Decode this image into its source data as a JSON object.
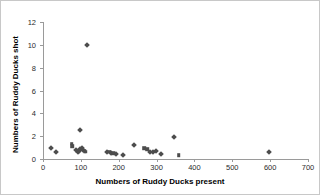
{
  "chart_data": {
    "type": "scatter",
    "title": "",
    "xlabel": "Numbers of Ruddy Ducks present",
    "ylabel": "Numbers of Ruddy Ducks shot",
    "xlim": [
      0,
      700
    ],
    "ylim": [
      0,
      12
    ],
    "xticks": [
      0,
      100,
      200,
      300,
      400,
      500,
      600,
      700
    ],
    "yticks": [
      0,
      2,
      4,
      6,
      8,
      10,
      12
    ],
    "grid": false,
    "legend": false,
    "marker_color": "#4d4d4d",
    "axis_color": "#9a9a9a",
    "points": [
      {
        "x": 20,
        "y": 1.0,
        "marker": "diamond"
      },
      {
        "x": 35,
        "y": 0.6,
        "marker": "diamond"
      },
      {
        "x": 76,
        "y": 1.35,
        "marker": "square"
      },
      {
        "x": 77,
        "y": 1.1,
        "marker": "square"
      },
      {
        "x": 88,
        "y": 0.75,
        "marker": "diamond"
      },
      {
        "x": 92,
        "y": 0.65,
        "marker": "diamond"
      },
      {
        "x": 95,
        "y": 0.7,
        "marker": "diamond"
      },
      {
        "x": 98,
        "y": 2.55,
        "marker": "diamond"
      },
      {
        "x": 99,
        "y": 0.85,
        "marker": "diamond"
      },
      {
        "x": 103,
        "y": 0.95,
        "marker": "diamond"
      },
      {
        "x": 106,
        "y": 0.8,
        "marker": "diamond"
      },
      {
        "x": 110,
        "y": 0.7,
        "marker": "square"
      },
      {
        "x": 113,
        "y": 0.65,
        "marker": "square"
      },
      {
        "x": 115,
        "y": 10.0,
        "marker": "diamond"
      },
      {
        "x": 170,
        "y": 0.6,
        "marker": "diamond"
      },
      {
        "x": 175,
        "y": 0.65,
        "marker": "square"
      },
      {
        "x": 180,
        "y": 0.55,
        "marker": "diamond"
      },
      {
        "x": 186,
        "y": 0.5,
        "marker": "square"
      },
      {
        "x": 193,
        "y": 0.45,
        "marker": "diamond"
      },
      {
        "x": 210,
        "y": 0.35,
        "marker": "diamond"
      },
      {
        "x": 240,
        "y": 1.2,
        "marker": "diamond"
      },
      {
        "x": 268,
        "y": 0.95,
        "marker": "square"
      },
      {
        "x": 275,
        "y": 0.85,
        "marker": "square"
      },
      {
        "x": 283,
        "y": 0.6,
        "marker": "diamond"
      },
      {
        "x": 290,
        "y": 0.6,
        "marker": "diamond"
      },
      {
        "x": 298,
        "y": 0.7,
        "marker": "diamond"
      },
      {
        "x": 312,
        "y": 0.45,
        "marker": "diamond"
      },
      {
        "x": 345,
        "y": 1.9,
        "marker": "diamond"
      },
      {
        "x": 358,
        "y": 0.35,
        "marker": "square"
      },
      {
        "x": 597,
        "y": 0.6,
        "marker": "diamond"
      }
    ]
  }
}
